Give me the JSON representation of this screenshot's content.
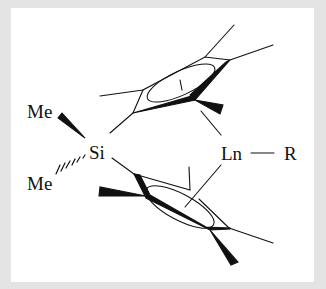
{
  "figure": {
    "type": "chemical-structure",
    "colors": {
      "background_border": "#e4e4e4",
      "canvas": "#ffffff",
      "ink": "#111111"
    }
  },
  "labels": {
    "me_top": "Me",
    "me_bottom": "Me",
    "silicon": "Si",
    "lanthanide": "Ln",
    "ligand": "R"
  },
  "bonds": {
    "ln_r": "single",
    "si_me_top": "wedge",
    "si_me_bottom": "hashed-wedge"
  },
  "rings": [
    {
      "name": "upper-cp-ring",
      "substituents": 4,
      "aromatic_circle": true
    },
    {
      "name": "lower-cp-ring",
      "substituents": 4,
      "aromatic_circle": true
    }
  ]
}
